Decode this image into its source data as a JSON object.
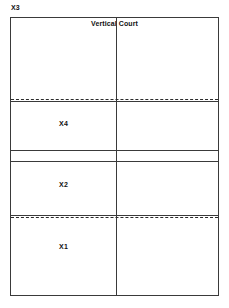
{
  "diagram": {
    "title": "Vertical Court",
    "corner_label": "X3",
    "background_color": "#ffffff",
    "line_color": "#3a3a3a",
    "text_color": "#111111",
    "zones": [
      {
        "id": "x4",
        "label": "X4"
      },
      {
        "id": "x2",
        "label": "X2"
      },
      {
        "id": "x1",
        "label": "X1"
      }
    ],
    "lines": {
      "center_vertical": "solid",
      "serve_line": "solid",
      "serve_line_marker": "dashed",
      "mid_upper": "solid",
      "mid_lower": "solid",
      "back_line": "solid",
      "back_line_marker": "dashed"
    }
  }
}
